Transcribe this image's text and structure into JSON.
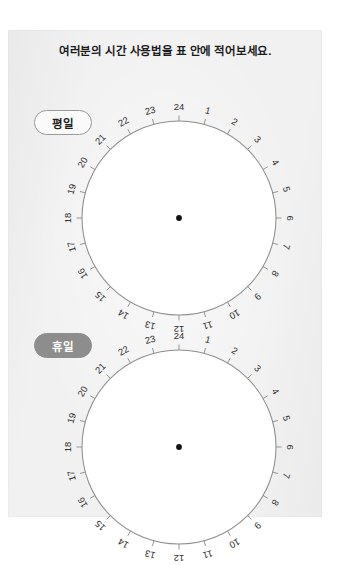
{
  "page": {
    "background_color": "#ffffff",
    "sheet_color": "#f1f1f1"
  },
  "title": "여러분의 시간 사용법을 표 안에 적어보세요.",
  "sections": [
    {
      "id": "weekday",
      "label": "평일",
      "pill_style": "outline",
      "pill_fill": "#fafafa",
      "pill_border": "#9a9a9a",
      "pill_text_color": "#1e1e1e"
    },
    {
      "id": "holiday",
      "label": "휴일",
      "pill_style": "filled",
      "pill_fill": "#8d8d8d",
      "pill_border": "#8d8d8d",
      "pill_text_color": "#ffffff"
    }
  ],
  "clock": {
    "hours_total": 24,
    "hour_labels": [
      "1",
      "2",
      "3",
      "4",
      "5",
      "6",
      "7",
      "8",
      "9",
      "10",
      "11",
      "12",
      "13",
      "14",
      "15",
      "16",
      "17",
      "18",
      "19",
      "20",
      "21",
      "22",
      "23",
      "24"
    ],
    "top_label": "24",
    "bottom_label": "12",
    "right_label": "6",
    "left_label": "18",
    "stroke_color": "#8e8e8e",
    "fill_color": "#ffffff",
    "number_color": "#303030",
    "center_dot_color": "#121212",
    "labels_rotate_with_dial": true
  }
}
